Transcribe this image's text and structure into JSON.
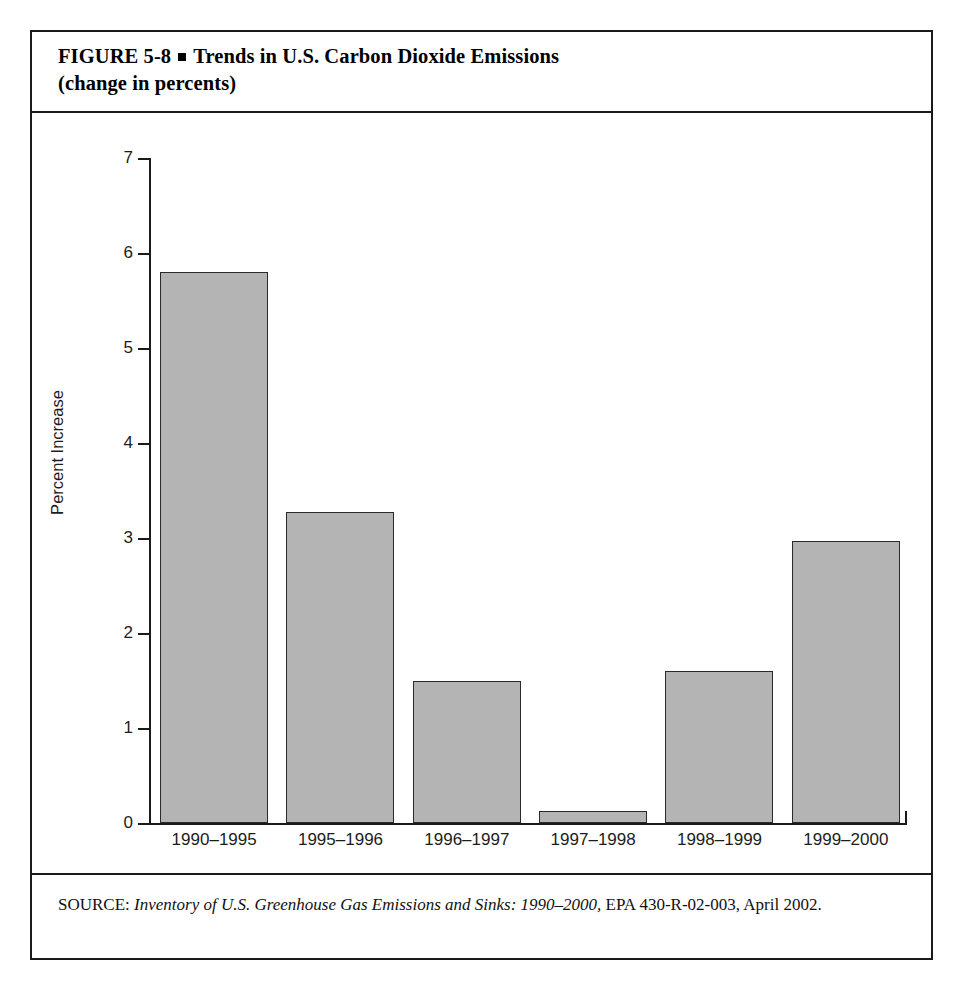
{
  "figure": {
    "label": "FIGURE  5-8",
    "bullet": "square-bullet",
    "title_line1": "Trends in U.S. Carbon Dioxide Emissions",
    "title_line2": "(change in percents)"
  },
  "source": {
    "prefix": "SOURCE:",
    "italic_part": "Inventory of U.S. Greenhouse Gas Emissions and Sinks: 1990–2000,",
    "rest": " EPA 430-R-02-003, April 2002."
  },
  "chart_data": {
    "type": "bar",
    "title": "Trends in U.S. Carbon Dioxide Emissions (change in percents)",
    "xlabel": "",
    "ylabel": "Percent Increase",
    "categories": [
      "1990–1995",
      "1995–1996",
      "1996–1997",
      "1997–1998",
      "1998–1999",
      "1999–2000"
    ],
    "values": [
      5.8,
      3.27,
      1.5,
      0.13,
      1.6,
      2.97
    ],
    "ylim": [
      0,
      7
    ],
    "yticks": [
      0,
      1,
      2,
      3,
      4,
      5,
      6,
      7
    ],
    "ytick_labels": [
      "0",
      "1",
      "2",
      "3",
      "4",
      "5",
      "6",
      "7"
    ],
    "grid": false,
    "legend": null,
    "bar_color": "#b4b4b4",
    "bar_edge_color": "#2a2a2a"
  }
}
